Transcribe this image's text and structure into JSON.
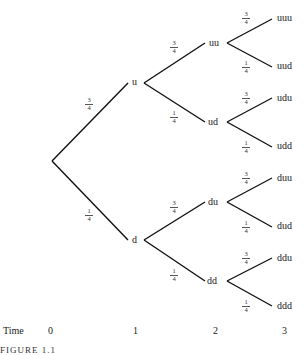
{
  "diagram": {
    "type": "binomial-tree",
    "root": {
      "label": ""
    },
    "time1": {
      "u": "u",
      "d": "d"
    },
    "time2": {
      "uu": "uu",
      "ud": "ud",
      "du": "du",
      "dd": "dd"
    },
    "time3": {
      "uuu": "uuu",
      "uud": "uud",
      "udu": "udu",
      "udd": "udd",
      "duu": "duu",
      "dud": "dud",
      "ddu": "ddu",
      "ddd": "ddd"
    },
    "prob_up": {
      "num": "3",
      "den": "4"
    },
    "prob_down": {
      "num": "1",
      "den": "4"
    },
    "axis": {
      "label": "Time",
      "ticks": [
        "0",
        "1",
        "2",
        "3"
      ]
    },
    "caption": "FIGURE 1.1"
  }
}
